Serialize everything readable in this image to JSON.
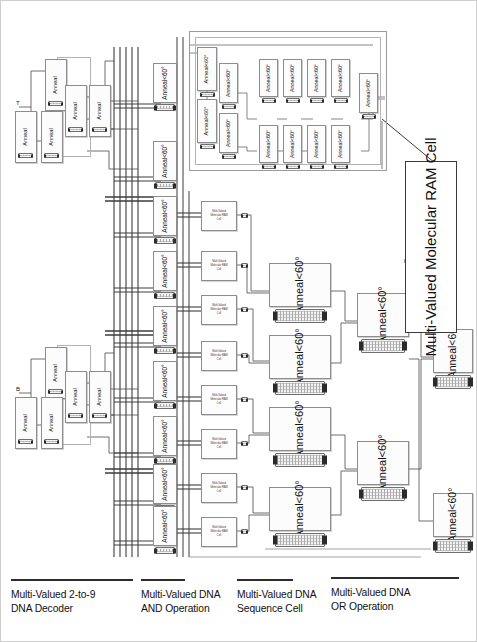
{
  "diagram": {
    "anneal_label_line1": "Anneal",
    "anneal_label_line2": "<60°",
    "ram_cell_line1": "Multi-Valued",
    "ram_cell_line2": "Molecular RAM",
    "ram_cell_line3": "Cell",
    "callout_line1": "Multi-Valued Molecular",
    "callout_line2": "RAM Cell",
    "decoder_input_top": "T",
    "decoder_input_bottom": "B",
    "colors": {
      "box_border": "#8d8d8d",
      "frame_border": "#9a9a9a",
      "callout_border": "#3a3a3a",
      "wire": "#4a4a4a",
      "bus": "#3c3c3c",
      "background": "#ffffff",
      "text": "#111111"
    }
  },
  "captions": [
    {
      "id": "decoder",
      "line1": "Multi-Valued 2-to-9",
      "line2": "DNA Decoder",
      "x": 10,
      "y": 12,
      "rule_width": 122
    },
    {
      "id": "and",
      "line1": "Multi-Valued DNA",
      "line2": "AND Operation",
      "x": 140,
      "y": 12,
      "rule_width": 44
    },
    {
      "id": "sequence",
      "line1": "Multi-Valued DNA",
      "line2": "Sequence Cell",
      "x": 236,
      "y": 12,
      "rule_width": 56
    },
    {
      "id": "or",
      "line1": "Multi-Valued DNA",
      "line2": "OR Operation",
      "x": 330,
      "y": 10,
      "rule_width": 128
    }
  ],
  "sections": {
    "decoder": {
      "name": "Multi-Valued 2-to-9 DNA Decoder",
      "anneal_count": 10
    },
    "and_operation": {
      "name": "Multi-Valued DNA AND Operation",
      "anneal_count": 9
    },
    "sequence_cell": {
      "name": "Multi-Valued DNA Sequence Cell",
      "ram_cell_count": 8
    },
    "or_operation": {
      "name": "Multi-Valued DNA OR Operation",
      "stage1_count": 4,
      "stage2_count": 2,
      "stage3_count": 2,
      "anneal_count": 8
    },
    "ram_cell_detail": {
      "name": "Multi-Valued Molecular RAM Cell (expanded detail)",
      "anneal_count": 13
    }
  },
  "bus": {
    "line_count": 5
  }
}
